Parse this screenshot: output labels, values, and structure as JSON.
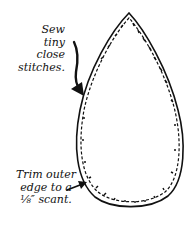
{
  "diagram": {
    "shape": "teardrop",
    "stroke_color": "#111111",
    "background": "#ffffff",
    "annotations": [
      {
        "id": "sew",
        "lines": [
          "Sew",
          "tiny",
          "close",
          "stitches."
        ],
        "points_to": "inner stitched edge, upper left"
      },
      {
        "id": "trim",
        "lines": [
          "Trim outer",
          "edge to a",
          "⅛″ scant."
        ],
        "points_to": "outer cut edge, lower left"
      }
    ]
  }
}
